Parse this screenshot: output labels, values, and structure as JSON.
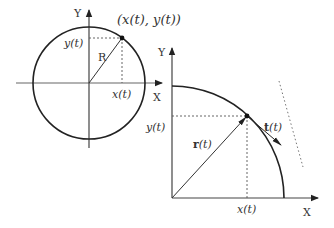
{
  "diagram": {
    "left_panel": {
      "axis_x_label": "X",
      "axis_y_label": "Y",
      "point_label": "(x(t), y(t))",
      "radius_label": "R",
      "x_projection_label": "x(t)",
      "y_projection_label": "y(t)"
    },
    "right_panel": {
      "axis_x_label": "X",
      "axis_y_label": "Y",
      "position_vector_label_bold": "r",
      "position_vector_label_rest": "(t)",
      "tangent_vector_label_bold": "t",
      "tangent_vector_label_rest": "(t)",
      "x_projection_label": "x(t)",
      "y_projection_label": "y(t)"
    },
    "colors": {
      "stroke": "#222222",
      "dashed": "#555555",
      "text": "#333333"
    }
  }
}
